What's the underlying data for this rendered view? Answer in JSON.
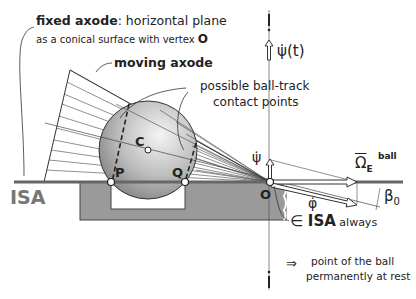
{
  "labels": {
    "fixed_axode_bold": "fixed axode",
    "fixed_axode_rest": ": horizontal plane",
    "fixed_axode_line2": "as a conical surface  with vertex ",
    "vertex_O_bold": "O",
    "moving_axode": "moving axode",
    "contact_points_line1": "possible ball-track",
    "contact_points_line2": "contact points",
    "point_C": "C",
    "point_P": "P",
    "point_Q": "Q",
    "point_O": "O",
    "isa": "ISA",
    "psi_dot_bar_t": "ψ̇(t)",
    "psi_dot": "ψ̇",
    "phi_dot": "φ̇",
    "omega": "Ω",
    "omega_sub": "E",
    "omega_sup": "ball",
    "beta": "β",
    "beta_sub": "0",
    "in_isa_symbol": "∈ ",
    "in_isa_bold": "ISA",
    "in_isa_rest": " always",
    "implies": "⇒",
    "rest_line1": "point of the ball",
    "rest_line2": "permanently at rest"
  },
  "colors": {
    "line": "#333333",
    "track": "#8a8a8a",
    "isa_line": "#666666",
    "ball_light": "#f0f0f0",
    "ball_dark": "#8c8c8c",
    "isa_text": "#777777"
  }
}
